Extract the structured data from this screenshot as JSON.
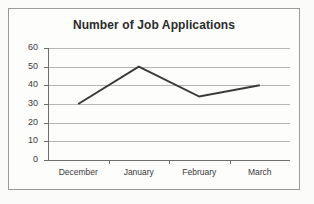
{
  "chart_data": {
    "type": "line",
    "title": "Number of Job Applications",
    "xlabel": "",
    "ylabel": "",
    "categories": [
      "December",
      "January",
      "February",
      "March"
    ],
    "values": [
      30,
      50,
      34,
      40
    ],
    "series": [
      {
        "name": "Job Applications",
        "values": [
          30,
          50,
          34,
          40
        ]
      }
    ],
    "ylim": [
      0,
      60
    ],
    "yticks": [
      0,
      10,
      20,
      30,
      40,
      50,
      60
    ],
    "ytick_labels": [
      "0",
      "10",
      "20",
      "30",
      "40",
      "50",
      "60"
    ],
    "grid": "horizontal",
    "legend": "none",
    "markers": "none",
    "colors": {
      "line": "#3a3a3a",
      "gridline": "#b5b5b5",
      "axis": "#6e6e6e",
      "border": "#9a9a9a",
      "background": "#fdfdfc",
      "text": "#3a3a3a",
      "title": "#2b2b2b"
    }
  }
}
